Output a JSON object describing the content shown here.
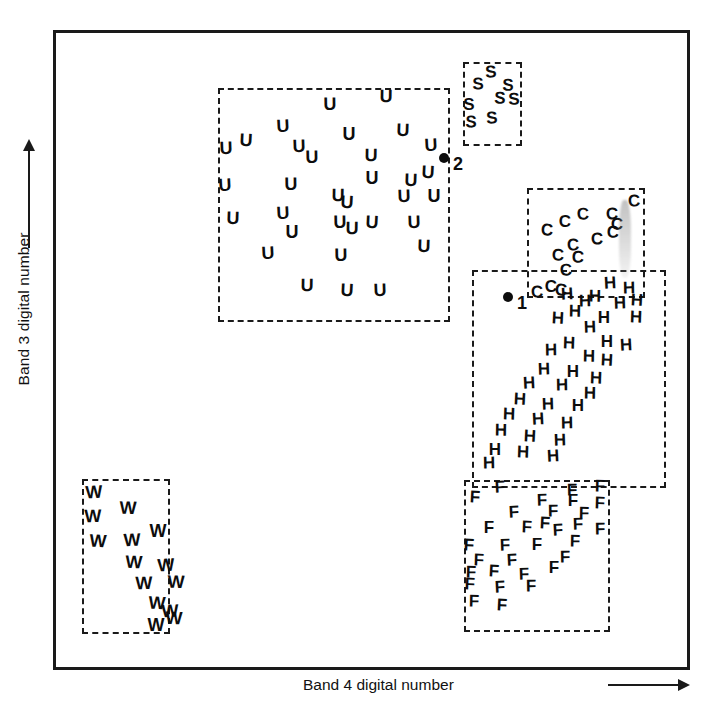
{
  "figure": {
    "type": "scatter",
    "background": "#ffffff",
    "ink_color": "#0d0d0d",
    "xlabel": "Band 4 digital number",
    "ylabel": "Band 3 digital number",
    "x_arrow": "right-arrow",
    "y_arrow": "up-arrow",
    "frame": {
      "x": 53,
      "y": 30,
      "w": 637,
      "h": 640
    }
  },
  "chart_data": {
    "type": "scatter",
    "title": "",
    "xlabel": "Band 4 digital number",
    "ylabel": "Band 3 digital number",
    "grid": false,
    "legend": "none",
    "axis_ticks": "none",
    "xlim": [
      53,
      690
    ],
    "ylim": [
      670,
      30
    ],
    "note": "Symbol-coded spectral classes plotted in Band 4 vs Band 3 feature space; dashed rectangles are class decision boxes (parallelepiped classifier).",
    "classes": [
      {
        "symbol": "U",
        "name": "urban",
        "count": 33,
        "box": {
          "x": 218,
          "y": 88,
          "w": 232,
          "h": 234
        }
      },
      {
        "symbol": "S",
        "name": "sand",
        "count": 8,
        "box": {
          "x": 463,
          "y": 62,
          "w": 59,
          "h": 84
        }
      },
      {
        "symbol": "C",
        "name": "corn",
        "count": 15,
        "box": {
          "x": 527,
          "y": 188,
          "w": 118,
          "h": 110
        }
      },
      {
        "symbol": "H",
        "name": "hay",
        "count": 37,
        "box": {
          "x": 472,
          "y": 270,
          "w": 194,
          "h": 218
        }
      },
      {
        "symbol": "F",
        "name": "forest",
        "count": 32,
        "box": {
          "x": 464,
          "y": 480,
          "w": 146,
          "h": 152
        }
      },
      {
        "symbol": "W",
        "name": "water",
        "count": 14,
        "box": {
          "x": 82,
          "y": 479,
          "w": 88,
          "h": 155
        }
      }
    ],
    "reference_points": [
      {
        "label": "1",
        "x": 508,
        "y": 297,
        "label_side": "left"
      },
      {
        "label": "2",
        "x": 444,
        "y": 158,
        "label_side": "left"
      }
    ],
    "points": {
      "U": [
        [
          283,
          126
        ],
        [
          330,
          104
        ],
        [
          386,
          96
        ],
        [
          246,
          140
        ],
        [
          299,
          146
        ],
        [
          349,
          134
        ],
        [
          403,
          130
        ],
        [
          431,
          145
        ],
        [
          312,
          157
        ],
        [
          371,
          155
        ],
        [
          428,
          172
        ],
        [
          226,
          148
        ],
        [
          372,
          178
        ],
        [
          411,
          180
        ],
        [
          225,
          185
        ],
        [
          291,
          184
        ],
        [
          338,
          195
        ],
        [
          347,
          202
        ],
        [
          404,
          196
        ],
        [
          434,
          196
        ],
        [
          233,
          218
        ],
        [
          283,
          213
        ],
        [
          340,
          222
        ],
        [
          352,
          228
        ],
        [
          372,
          222
        ],
        [
          414,
          222
        ],
        [
          292,
          232
        ],
        [
          424,
          246
        ],
        [
          268,
          253
        ],
        [
          341,
          255
        ],
        [
          307,
          285
        ],
        [
          347,
          290
        ],
        [
          380,
          290
        ]
      ],
      "S": [
        [
          491,
          72
        ],
        [
          478,
          84
        ],
        [
          508,
          85
        ],
        [
          500,
          98
        ],
        [
          514,
          99
        ],
        [
          469,
          104
        ],
        [
          471,
          122
        ],
        [
          492,
          118
        ]
      ],
      "C": [
        [
          634,
          201
        ],
        [
          612,
          214
        ],
        [
          617,
          224
        ],
        [
          613,
          232
        ],
        [
          583,
          214
        ],
        [
          565,
          221
        ],
        [
          547,
          230
        ],
        [
          573,
          245
        ],
        [
          597,
          239
        ],
        [
          558,
          255
        ],
        [
          578,
          257
        ],
        [
          566,
          270
        ],
        [
          551,
          286
        ],
        [
          561,
          290
        ],
        [
          537,
          292
        ]
      ],
      "H": [
        [
          610,
          283
        ],
        [
          629,
          288
        ],
        [
          595,
          296
        ],
        [
          637,
          300
        ],
        [
          620,
          303
        ],
        [
          604,
          317
        ],
        [
          636,
          317
        ],
        [
          567,
          294
        ],
        [
          585,
          301
        ],
        [
          575,
          311
        ],
        [
          558,
          318
        ],
        [
          590,
          327
        ],
        [
          607,
          341
        ],
        [
          569,
          343
        ],
        [
          626,
          345
        ],
        [
          551,
          350
        ],
        [
          589,
          356
        ],
        [
          607,
          360
        ],
        [
          544,
          369
        ],
        [
          573,
          371
        ],
        [
          596,
          378
        ],
        [
          529,
          383
        ],
        [
          562,
          385
        ],
        [
          590,
          393
        ],
        [
          520,
          399
        ],
        [
          548,
          404
        ],
        [
          578,
          405
        ],
        [
          509,
          414
        ],
        [
          538,
          419
        ],
        [
          567,
          423
        ],
        [
          501,
          430
        ],
        [
          530,
          436
        ],
        [
          560,
          440
        ],
        [
          495,
          449
        ],
        [
          523,
          452
        ],
        [
          553,
          456
        ],
        [
          489,
          463
        ]
      ],
      "F": [
        [
          500,
          487
        ],
        [
          572,
          490
        ],
        [
          600,
          486
        ],
        [
          475,
          497
        ],
        [
          542,
          500
        ],
        [
          573,
          500
        ],
        [
          600,
          503
        ],
        [
          514,
          512
        ],
        [
          553,
          511
        ],
        [
          584,
          513
        ],
        [
          545,
          523
        ],
        [
          578,
          524
        ],
        [
          489,
          527
        ],
        [
          527,
          527
        ],
        [
          558,
          530
        ],
        [
          600,
          529
        ],
        [
          575,
          541
        ],
        [
          469,
          545
        ],
        [
          505,
          545
        ],
        [
          537,
          544
        ],
        [
          479,
          560
        ],
        [
          512,
          560
        ],
        [
          565,
          557
        ],
        [
          471,
          572
        ],
        [
          494,
          571
        ],
        [
          524,
          574
        ],
        [
          554,
          567
        ],
        [
          470,
          584
        ],
        [
          500,
          587
        ],
        [
          531,
          586
        ],
        [
          474,
          601
        ],
        [
          502,
          605
        ]
      ],
      "W": [
        [
          94,
          492
        ],
        [
          93,
          516
        ],
        [
          128,
          508
        ],
        [
          98,
          541
        ],
        [
          132,
          540
        ],
        [
          158,
          531
        ],
        [
          134,
          562
        ],
        [
          166,
          565
        ],
        [
          144,
          583
        ],
        [
          176,
          582
        ],
        [
          157,
          603
        ],
        [
          170,
          611
        ],
        [
          156,
          625
        ],
        [
          174,
          618
        ]
      ]
    }
  }
}
